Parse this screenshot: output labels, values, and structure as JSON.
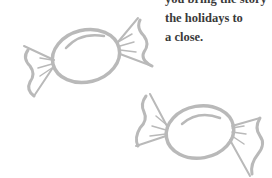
{
  "text": {
    "lines": [
      "you bring the story",
      "the holidays to",
      "a close."
    ]
  },
  "illustrations": [
    {
      "name": "wrapped-candy",
      "color": "#b9b9b9"
    },
    {
      "name": "wrapped-candy",
      "color": "#b9b9b9"
    }
  ]
}
